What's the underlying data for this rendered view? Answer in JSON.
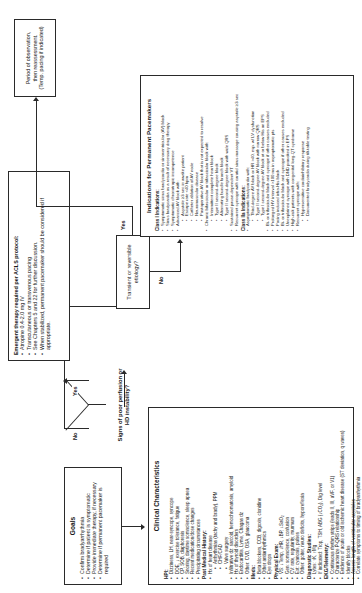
{
  "document": {
    "title": "Bradycardia Evaluation and Management Algorithm",
    "orientation": "landscape-rotated-90-ccw"
  },
  "goals": {
    "title": "Goals",
    "items": [
      "Confirm bradyarrhythmia",
      "Determine if patient is symptomatic",
      "Provide immediate therapy, if necessary",
      "Determine if permanent pacemaker is required"
    ]
  },
  "clinical": {
    "title": "Clinical Characteristics",
    "sections": [
      {
        "heading": "HPI:",
        "items": [
          "Dizziness, LH, near-syncope, syncope",
          "DOE, ↓ exercise tolerance, fatigue",
          "CP, SOB, diaphoresis",
          "Snoring, daytime somnolence, sleep apnea",
          "Recent medication/dose changes",
          "Precipitating circumstances"
        ]
      },
      {
        "heading": "Past Medical History:",
        "items": [
          "Hx of heart disease",
          "Arrhythmias (tachy and brady), PPM",
          "CHF/CAD",
          "Valve surgery",
          "Infiltrative dz: sarcoid, hemochromatosis, amyloid",
          "Hx of thyroid disorders",
          "Endocarditis, Lyme, Chagas dz",
          "Other: CVD, OSA, glaucoma"
        ],
        "subitems_start": 1,
        "subitems_end": 3
      },
      {
        "heading": "Meds:",
        "items": [
          "Beta blockers, CCB, digoxin, clonidine",
          "Other antiarrhythmics",
          "Eye drops"
        ]
      },
      {
        "heading": "Physical Exam:",
        "items": [
          "VS: ↓Temp, ↓HR, ↓BP, ↓SaO₂",
          "Gen: somnolence, confusion",
          "CV: rate, regularity, murmurs",
          "Ext: cyanosis, pulses",
          "Other: goiter, neuro deficits, hyporeflexia"
        ]
      },
      {
        "heading": "Diagnostic Studies:",
        "items": [
          "Lytes: ↑K, ↑Mg",
          "If indicated: Trop, TSH, ABG (↓CO₂), Dig level"
        ]
      },
      {
        "heading": "EKG/Telemetry:",
        "items": [
          "Continuous rhythm strips (leads II, III, aVF, or V1)",
          "Characterize P-QRS relationship",
          "Evidence of acute or old ischemic heart disease (ST deviation, q waves)",
          "Identify blocks",
          "Assess length of ventricular asystoles",
          "Correlate symptoms to timing of bradyarrhythmia"
        ]
      }
    ]
  },
  "decision": {
    "label": "Signs of poor perfusion or HD instability?",
    "yes": "Yes",
    "no": "No"
  },
  "emergent": {
    "items": [
      "Emergent therapy required per ACLS protocol:",
      "Atropine 0.4-2.0 mg IV",
      "Transcutaneous or transvenous pacing",
      "See Chapters 5 and 22 for further discussion.",
      "When stabilized, permanent pacemaker should be considered if appropriate."
    ]
  },
  "period": {
    "lines": [
      "Period of observation,",
      "then reassessment.",
      "(Temp. pacing if indicated)"
    ]
  },
  "transient": {
    "label": "Transient or reversible etiology?",
    "yes": "Yes",
    "no": "No"
  },
  "indications": {
    "title": "Indications for Permanent Pacemakers",
    "sections": [
      {
        "heading": "Class I Indications:",
        "items": [
          "Symptomatic sinus bradycardia or sinoventricular (AV) block",
          "Sinus bradycardia as a result of necessary drug therapy",
          "Symptomatic chronotropic incompetence",
          "Advanced AV block with:",
          "Asystole ≥3 sec in awake patient",
          "Escape rate <40 bpm",
          "Catheter ablation of AV node",
          "Neuromuscular disease",
          "Postoperative AV block that is not expected to resolve",
          "Chronic bifascicular or trifascicular block with:",
          "Intermittent complete heart block",
          "Type II second-degree block",
          "Alternating bundle branch block",
          "Type II second-degree block with wide QRS",
          "Sustained pause-dependent VT",
          "Recurrent syncope with carotid sinus massage causing asystole ≥3 sec"
        ]
      },
      {
        "heading": "Class IIa Indications:",
        "items": [
          "Asymptomatic bradycardia with:",
          "Third-degree AV block or HR >40, esp. w/ LV dysfunction",
          "Type II second-degree AV block with narrow QRS",
          "Type I second-degree AV block at or below His on EPS",
          "Bi- or trifascicular block and syncope if other causes excluded",
          "Prolonged HV interval >100 ms in asymptomatic pts",
          "Pacing induced infra-His block",
          "Bi- or trifascicular block and syncope if other causes excluded",
          "Unexplained syncope with DND provoked in EPS",
          "High-risk patients with congenital long-QT syndrome",
          "Recurrent syncope with:",
          "Hypersensitive cardioinhibitory response",
          "Documented bradycardia during tilt-table testing"
        ]
      }
    ]
  }
}
